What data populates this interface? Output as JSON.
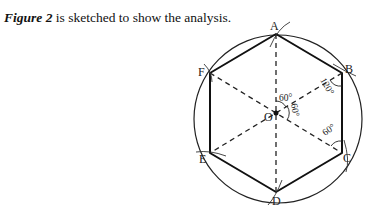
{
  "caption": {
    "figure_ref": "Figure 2",
    "text": " is sketched to show the analysis."
  },
  "figure": {
    "type": "geometric construction: regular hexagon inscribed in circle",
    "center_label": "O",
    "vertices": [
      "A",
      "B",
      "C",
      "D",
      "E",
      "F"
    ],
    "angle_labels": {
      "center_top": "60°",
      "center_right": "60°",
      "at_B": "120°",
      "at_C": "60°"
    }
  }
}
